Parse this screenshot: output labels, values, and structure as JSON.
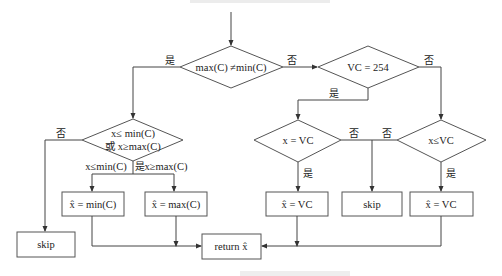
{
  "flowchart": {
    "decisions": {
      "d1": {
        "label": "max(C) ≠min(C)",
        "yes": "是",
        "no": "否"
      },
      "d2": {
        "label": "VC = 254",
        "yes": "是",
        "no": "否"
      },
      "d3": {
        "line1": "x≤ min(C)",
        "line2": "或 x≥max(C)",
        "no": "否",
        "branch_left": "x≤min(C)",
        "yes": "是",
        "branch_right": "x≥max(C)"
      },
      "d4": {
        "label": "x = VC",
        "yes": "是",
        "no": "否"
      },
      "d5": {
        "label": "x≤VC",
        "yes": "是",
        "no": "否"
      }
    },
    "processes": {
      "skip_left": "skip",
      "set_min": "x̂ = min(C)",
      "set_max": "x̂ = max(C)",
      "set_vc_1": "x̂ = VC",
      "skip_mid": "skip",
      "set_vc_2": "x̂ = VC",
      "return": "return x̂"
    }
  }
}
